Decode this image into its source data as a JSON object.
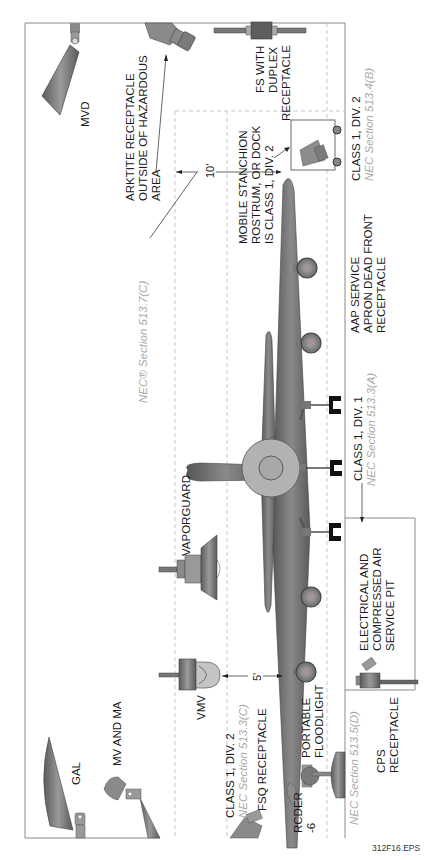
{
  "figure_id": "312F16.EPS",
  "orientation": "rotated 90 degrees counter-clockwise (text reads bottom-to-top)",
  "colors": {
    "label": "#1a1a1a",
    "nec_reference": "#a9a9a9",
    "aircraft": "#6f6f6f",
    "fixture": "#7c7c7c",
    "dashed_zone": "#b9b9b9",
    "frame": "#8a8a8a"
  },
  "dimensions": {
    "ten_foot": "10'",
    "five_foot": "5'"
  },
  "labels": {
    "mvd": "MVD",
    "arktite": [
      "ARKTITE RECEPTACLE",
      "OUTSIDE OF HAZARDOUS",
      "AREA"
    ],
    "fs_duplex": [
      "FS WITH",
      "DUPLEX",
      "RECEPTACLE"
    ],
    "mobile_stanchion": [
      "MOBILE STANCHION",
      "ROSTRUM, OR DOCK",
      "IS CLASS 1, DIV. 2"
    ],
    "class1_div2_right": "CLASS 1, DIV. 2",
    "nec_513_4b": "NEC Section 513.4(B)",
    "nec_513_7c": "NEC® Section 513.7(C)",
    "aap_service": [
      "AAP SERVICE",
      "APRON DEAD FRONT",
      "RECEPTACLE"
    ],
    "vaporguard": "VAPORGUARD",
    "class1_div1": "CLASS 1, DIV. 1",
    "nec_513_3a": "NEC Section 513.3(A)",
    "electrical_pit": [
      "ELECTRICAL AND",
      "COMPRESSED AIR",
      "SERVICE PIT"
    ],
    "gal": "GAL",
    "mv_and_ma": "MV AND MA",
    "vmv": "VMV",
    "class1_div2_left": "CLASS 1, DIV. 2",
    "nec_513_3c": "NEC Section 513.3(C)",
    "fsq_receptacle": "FSQ RECEPTACLE",
    "portable_floodlight": [
      "PORTABLE",
      "FLOODLIGHT"
    ],
    "rcder": [
      "RCDER",
      "-6"
    ],
    "nec_513_5d": "NEC Section 513.5(D)",
    "cps_receptacle": [
      "CPS",
      "RECEPTACLE"
    ]
  },
  "icons": {
    "mvd": "floodlight-fixture-icon",
    "arktite": "receptacle-plug-icon",
    "fs_duplex": "fs-box-icon",
    "mobile_stanchion": "stanchion-receptacle-icon",
    "vaporguard": "vaporguard-fixture-icon",
    "vmv": "vmv-fixture-icon",
    "gal": "gal-floodlight-icon",
    "mv_ma": "mv-floodlight-icon",
    "rcder": "rcder-plug-icon",
    "floodlight": "portable-floodlight-icon",
    "cps": "cps-receptacle-icon",
    "aircraft": "aircraft-icon"
  }
}
